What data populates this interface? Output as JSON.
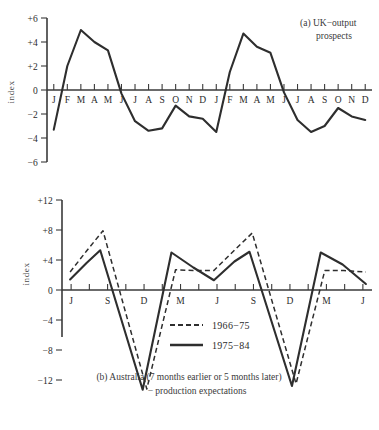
{
  "figure": {
    "background_color": "#ffffff",
    "ink_color": "#2e2e2e"
  },
  "chart_data": [
    {
      "id": "panel-a",
      "type": "line",
      "title": "(a)  UK−output",
      "title_line2": "prospects",
      "caption_marker": "(a)",
      "ylabel": "index",
      "xlabel": "",
      "ylim": [
        -6,
        6
      ],
      "yticks": [
        6,
        4,
        2,
        0,
        -2,
        -4,
        -6
      ],
      "ytick_labels": [
        "+6",
        "+4",
        "+2",
        "0",
        "−2",
        "−4",
        "−6"
      ],
      "grid": false,
      "legend_position": "none",
      "categories": [
        "J",
        "F",
        "M",
        "A",
        "M",
        "J",
        "J",
        "A",
        "S",
        "O",
        "N",
        "D",
        "J",
        "F",
        "M",
        "A",
        "M",
        "J",
        "J",
        "A",
        "S",
        "O",
        "N",
        "D"
      ],
      "series": [
        {
          "name": "UK output prospects",
          "style": "solid",
          "values": [
            -3.3,
            2.0,
            5.0,
            4.0,
            3.3,
            -0.3,
            -2.6,
            -3.4,
            -3.2,
            -1.3,
            -2.2,
            -2.4,
            -3.5,
            1.5,
            4.7,
            3.6,
            3.1,
            -0.2,
            -2.5,
            -3.5,
            -3.0,
            -1.5,
            -2.2,
            -2.5
          ]
        }
      ]
    },
    {
      "id": "panel-b",
      "type": "line",
      "title": "",
      "caption_line1": "(b)  Australia (7 months earlier or 5 months later)",
      "caption_line2": "− production expectations",
      "ylabel": "index",
      "xlabel": "",
      "ylim": [
        -14,
        12
      ],
      "yticks": [
        12,
        8,
        4,
        0,
        -4,
        -8,
        -12
      ],
      "ytick_labels": [
        "+12",
        "+8",
        "+4",
        "0",
        "−4",
        "−8",
        "−12"
      ],
      "grid": false,
      "legend_position": "inside-center",
      "major_tick_labels": [
        "J",
        "S",
        "D",
        "M",
        "J",
        "S",
        "D",
        "M",
        "J"
      ],
      "x": [
        0,
        1,
        2,
        3,
        4,
        5,
        6,
        7,
        8,
        9,
        10,
        11,
        12,
        13,
        14,
        15,
        16
      ],
      "series": [
        {
          "name": "1966−75",
          "style": "dashed",
          "values": [
            2.4,
            5.2,
            7.9,
            -13.2,
            2.7,
            2.6,
            2.6,
            5.3,
            7.6,
            -12.5,
            2.6,
            2.6,
            2.4
          ]
        },
        {
          "name": "1975−84",
          "style": "solid",
          "values": [
            1.4,
            3.6,
            5.3,
            -13.3,
            5.0,
            3.0,
            1.3,
            3.8,
            5.1,
            -12.8,
            5.0,
            3.4,
            0.8
          ]
        }
      ],
      "legend": [
        {
          "label": "1966−75",
          "style": "dashed"
        },
        {
          "label": "1975−84",
          "style": "solid"
        }
      ]
    }
  ]
}
